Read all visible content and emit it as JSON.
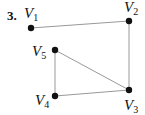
{
  "problem_number": "3.",
  "graph": {
    "vertices": [
      {
        "id": "V1",
        "letter": "V",
        "sub": "1",
        "x": 31,
        "y": 28,
        "lx": 24,
        "ly": 18
      },
      {
        "id": "V2",
        "letter": "V",
        "sub": "2",
        "x": 129,
        "y": 21,
        "lx": 124,
        "ly": 12
      },
      {
        "id": "V3",
        "letter": "V",
        "sub": "3",
        "x": 129,
        "y": 90,
        "lx": 124,
        "ly": 110
      },
      {
        "id": "V4",
        "letter": "V",
        "sub": "4",
        "x": 55,
        "y": 96,
        "lx": 35,
        "ly": 105
      },
      {
        "id": "V5",
        "letter": "V",
        "sub": "5",
        "x": 55,
        "y": 50,
        "lx": 32,
        "ly": 56
      }
    ],
    "edges": [
      [
        "V1",
        "V2"
      ],
      [
        "V2",
        "V3"
      ],
      [
        "V3",
        "V4"
      ],
      [
        "V4",
        "V5"
      ],
      [
        "V5",
        "V3"
      ]
    ],
    "colors": {
      "edge": "#999999",
      "node": "#111111"
    }
  }
}
